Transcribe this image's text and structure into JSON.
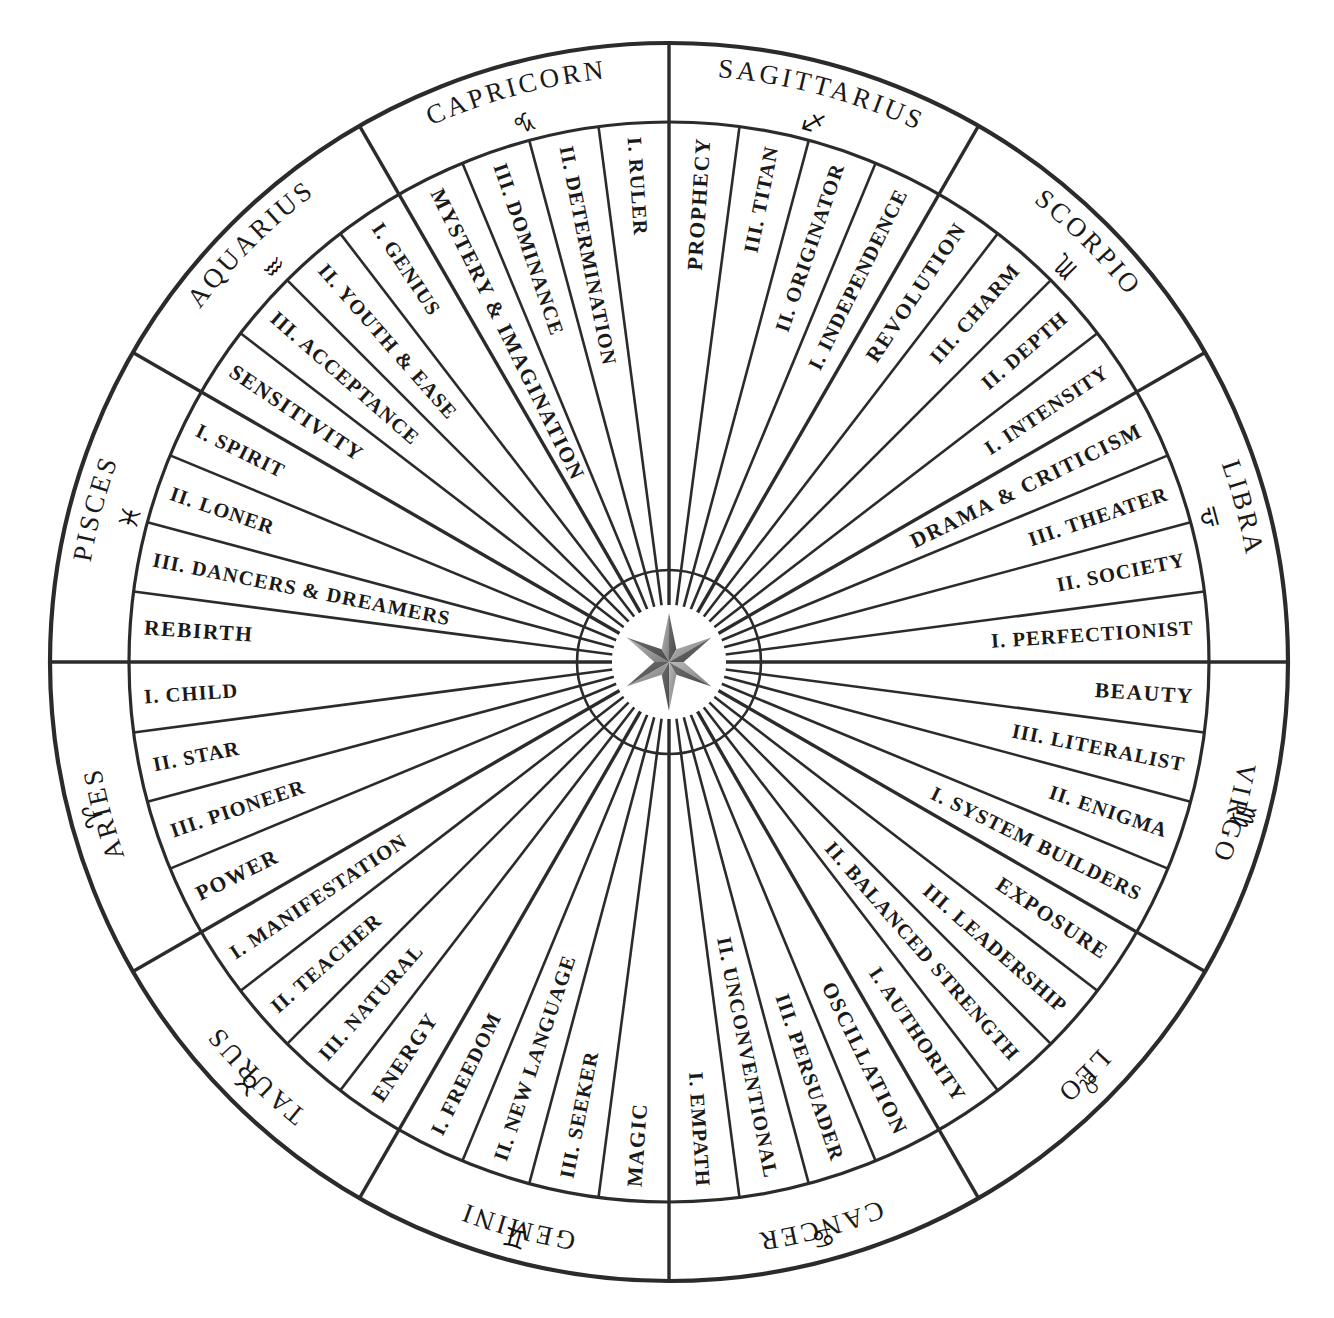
{
  "diagram": {
    "type": "astrological-wheel",
    "center_icon": "six-pointed-compass-star",
    "geometry": {
      "center_x": 669,
      "center_y": 662,
      "outer_radius": 619,
      "sign_ring_inner_radius": 540,
      "label_ring_inner_radius": 92,
      "hub_radius": 57
    },
    "colors": {
      "stroke": "#2b2b2b",
      "text": "#1a1a1a",
      "background": "#ffffff",
      "star_shade": "#8a8a8a"
    },
    "signs": [
      {
        "name": "SAGITTARIUS",
        "glyph": "♐",
        "glyph_name": "sagittarius-symbol",
        "start_angle": -90,
        "end_angle": -60,
        "segments": [
          "PROPHECY",
          "III. TITAN",
          "II. ORIGINATOR",
          "I. INDEPENDENCE"
        ]
      },
      {
        "name": "SCORPIO",
        "glyph": "♏",
        "glyph_name": "scorpio-symbol",
        "start_angle": -60,
        "end_angle": -30,
        "segments": [
          "REVOLUTION",
          "III. CHARM",
          "II. DEPTH",
          "I. INTENSITY"
        ]
      },
      {
        "name": "LIBRA",
        "glyph": "♎",
        "glyph_name": "libra-symbol",
        "start_angle": -30,
        "end_angle": 0,
        "segments": [
          "DRAMA & CRITICISM",
          "III. THEATER",
          "II. SOCIETY",
          "I. PERFECTIONIST"
        ]
      },
      {
        "name": "VIRGO",
        "glyph": "♍",
        "glyph_name": "virgo-symbol",
        "start_angle": 0,
        "end_angle": 30,
        "segments": [
          "BEAUTY",
          "III. LITERALIST",
          "II. ENIGMA",
          "I. SYSTEM BUILDERS"
        ]
      },
      {
        "name": "LEO",
        "glyph": "♌",
        "glyph_name": "leo-symbol",
        "start_angle": 30,
        "end_angle": 60,
        "segments": [
          "EXPOSURE",
          "III. LEADERSHIP",
          "II. BALANCED STRENGTH",
          "I. AUTHORITY"
        ]
      },
      {
        "name": "CANCER",
        "glyph": "♋",
        "glyph_name": "cancer-symbol",
        "start_angle": 60,
        "end_angle": 90,
        "segments": [
          "OSCILLATION",
          "III. PERSUADER",
          "II. UNCONVENTIONAL",
          "I. EMPATH"
        ]
      },
      {
        "name": "GEMINI",
        "glyph": "♊",
        "glyph_name": "gemini-symbol",
        "start_angle": 90,
        "end_angle": 120,
        "segments": [
          "MAGIC",
          "III. SEEKER",
          "II. NEW LANGUAGE",
          "I. FREEDOM"
        ]
      },
      {
        "name": "TAURUS",
        "glyph": "♉",
        "glyph_name": "taurus-symbol",
        "start_angle": 120,
        "end_angle": 150,
        "segments": [
          "ENERGY",
          "III. NATURAL",
          "II. TEACHER",
          "I. MANIFESTATION"
        ]
      },
      {
        "name": "ARIES",
        "glyph": "♈",
        "glyph_name": "aries-symbol",
        "start_angle": 150,
        "end_angle": 180,
        "segments": [
          "POWER",
          "III. PIONEER",
          "II. STAR",
          "I. CHILD"
        ]
      },
      {
        "name": "PISCES",
        "glyph": "♓",
        "glyph_name": "pisces-symbol",
        "start_angle": 180,
        "end_angle": 210,
        "segments": [
          "REBIRTH",
          "III. DANCERS & DREAMERS",
          "II. LONER",
          "I. SPIRIT"
        ]
      },
      {
        "name": "AQUARIUS",
        "glyph": "♒",
        "glyph_name": "aquarius-symbol",
        "start_angle": 210,
        "end_angle": 240,
        "segments": [
          "SENSITIVITY",
          "III. ACCEPTANCE",
          "II. YOUTH & EASE",
          "I. GENIUS"
        ]
      },
      {
        "name": "CAPRICORN",
        "glyph": "♑",
        "glyph_name": "capricorn-symbol",
        "start_angle": 240,
        "end_angle": 270,
        "segments": [
          "MYSTERY & IMAGINATION",
          "III. DOMINANCE",
          "II. DETERMINATION",
          "I. RULER"
        ]
      }
    ]
  }
}
